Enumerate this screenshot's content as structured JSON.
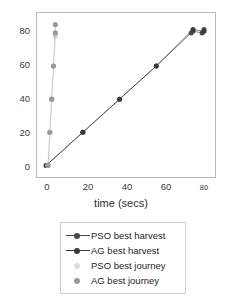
{
  "chart_data": {
    "type": "scatter",
    "title": "",
    "xlabel": "time (secs)",
    "ylabel": "",
    "xlim": [
      -5,
      92
    ],
    "ylim": [
      -7,
      92
    ],
    "grid": false,
    "legend_position": "below",
    "xticks": [
      0,
      20,
      40,
      60,
      80
    ],
    "yticks": [
      0,
      20,
      40,
      60,
      80
    ],
    "xtick_labels": [
      "0",
      "20",
      "40",
      "60",
      "80"
    ],
    "ytick_labels": [
      "0",
      "20",
      "40",
      "60",
      "80"
    ],
    "series": [
      {
        "name": "PSO best harvest",
        "color": "#4a4a4a",
        "marker": "circle",
        "line": true,
        "points": [
          {
            "x": 0,
            "y": 0
          },
          {
            "x": 20,
            "y": 20
          },
          {
            "x": 40,
            "y": 40
          },
          {
            "x": 60,
            "y": 60
          },
          {
            "x": 79,
            "y": 80
          },
          {
            "x": 80,
            "y": 81
          },
          {
            "x": 85,
            "y": 80
          },
          {
            "x": 86,
            "y": 82
          }
        ]
      },
      {
        "name": "AG best harvest",
        "color": "#3a3a3a",
        "marker": "circle",
        "line": true,
        "points": [
          {
            "x": 0,
            "y": 0
          },
          {
            "x": 20,
            "y": 20
          },
          {
            "x": 40,
            "y": 40
          },
          {
            "x": 60,
            "y": 60
          },
          {
            "x": 80,
            "y": 82
          },
          {
            "x": 86,
            "y": 81
          }
        ]
      },
      {
        "name": "PSO best journey",
        "color": "#d6d6d6",
        "marker": "circle",
        "line": true,
        "points": [
          {
            "x": 1,
            "y": 0
          },
          {
            "x": 2,
            "y": 20
          },
          {
            "x": 3,
            "y": 40
          },
          {
            "x": 4,
            "y": 60
          },
          {
            "x": 5,
            "y": 78
          }
        ]
      },
      {
        "name": "AG best journey",
        "color": "#9a9a9a",
        "marker": "circle",
        "line": true,
        "points": [
          {
            "x": 1,
            "y": 0
          },
          {
            "x": 2,
            "y": 20
          },
          {
            "x": 3,
            "y": 40
          },
          {
            "x": 4,
            "y": 60
          },
          {
            "x": 5,
            "y": 80
          },
          {
            "x": 5,
            "y": 85
          }
        ]
      }
    ]
  },
  "axes": {
    "xlabel": "time (secs)",
    "ytick_0": "0",
    "ytick_1": "20",
    "ytick_2": "40",
    "ytick_3": "60",
    "ytick_4": "80",
    "xtick_0": "0",
    "xtick_1": "20",
    "xtick_2": "40",
    "xtick_3": "60",
    "xtick_4": "80"
  },
  "legend": {
    "items": [
      {
        "label": "PSO best harvest",
        "color": "#4a4a4a",
        "line": true
      },
      {
        "label": "AG best harvest",
        "color": "#3a3a3a",
        "line": true
      },
      {
        "label": "PSO best journey",
        "color": "#dcdcdc",
        "line": false
      },
      {
        "label": "AG best journey",
        "color": "#9a9a9a",
        "line": false
      }
    ]
  },
  "colors": {
    "frame": "#b9b9b9",
    "legend_border": "#cfcfcf",
    "text": "#2e2e2e",
    "background": "#ffffff"
  }
}
